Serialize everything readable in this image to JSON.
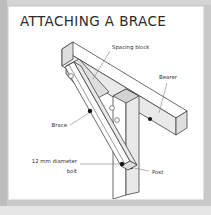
{
  "page": {
    "frame_color": "#c9c9c9",
    "card_color": "#ffffff"
  },
  "header": {
    "title": "ATTACHING A BRACE"
  },
  "figure": {
    "type": "isometric-construction-detail",
    "line_color": "#3a3a3a",
    "fill_light": "#ffffff",
    "fill_shade": "#e9e9e9",
    "fill_shade_dark": "#dcdcdc",
    "bolt_marker_color": "#1a1a1a",
    "labels": [
      {
        "id": "spacing-block",
        "text": "Spacing block",
        "anchor": "start",
        "x": 103,
        "y": 22
      },
      {
        "id": "bearer",
        "text": "Bearer",
        "anchor": "start",
        "x": 150,
        "y": 52
      },
      {
        "id": "brace",
        "text": "Brace",
        "anchor": "end",
        "x": 58,
        "y": 100
      },
      {
        "id": "bolt-line-1",
        "text": "12 mm diameter",
        "anchor": "end",
        "x": 68,
        "y": 139
      },
      {
        "id": "bolt-line-2",
        "text": "bolt",
        "anchor": "end",
        "x": 68,
        "y": 148
      },
      {
        "id": "post",
        "text": "Post",
        "anchor": "start",
        "x": 143,
        "y": 147
      }
    ],
    "parts": [
      {
        "id": "bearer",
        "name": "Bearer",
        "bolts": 2
      },
      {
        "id": "post",
        "name": "Post",
        "bolts": 1
      },
      {
        "id": "brace",
        "name": "Brace",
        "bolts": 3
      },
      {
        "id": "spacing-block",
        "name": "Spacing block",
        "bolts": 2
      }
    ],
    "fastener": {
      "description": "12 mm diameter bolt",
      "diameter_mm": 12
    }
  }
}
